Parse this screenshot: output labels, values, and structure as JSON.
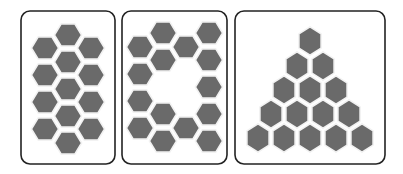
{
  "colors": {
    "background": "#ffffff",
    "hex_fill": "#6a6a6a",
    "hex_gap": "#f2f2f2",
    "border": "#222222"
  },
  "panels": [
    {
      "name": "panel-column-arrangement",
      "box": {
        "x": 21,
        "y": 11,
        "w": 94,
        "h": 153
      },
      "orientation": "flat",
      "hex_count": 13,
      "hexes": [
        [
          68,
          35
        ],
        [
          68,
          62
        ],
        [
          68,
          89
        ],
        [
          68,
          116
        ],
        [
          68,
          143
        ],
        [
          45,
          48
        ],
        [
          45,
          75
        ],
        [
          45,
          102
        ],
        [
          45,
          129
        ],
        [
          91,
          48
        ],
        [
          91,
          75
        ],
        [
          91,
          102
        ],
        [
          91,
          129
        ]
      ]
    },
    {
      "name": "panel-ring-arrangement",
      "box": {
        "x": 122,
        "y": 11,
        "w": 105,
        "h": 153
      },
      "orientation": "flat",
      "hex_count": 15,
      "hexes": [
        [
          140,
          47
        ],
        [
          140,
          74
        ],
        [
          140,
          101
        ],
        [
          140,
          128
        ],
        [
          163,
          33
        ],
        [
          163,
          60
        ],
        [
          163,
          114
        ],
        [
          163,
          141
        ],
        [
          186,
          47
        ],
        [
          186,
          128
        ],
        [
          209,
          33
        ],
        [
          209,
          60
        ],
        [
          209,
          87
        ],
        [
          209,
          114
        ],
        [
          209,
          141
        ]
      ]
    },
    {
      "name": "panel-triangle-arrangement",
      "box": {
        "x": 235,
        "y": 11,
        "w": 150,
        "h": 153
      },
      "orientation": "pointy",
      "hex_count": 15,
      "hexes": [
        [
          310,
          41
        ],
        [
          297,
          66
        ],
        [
          323,
          66
        ],
        [
          284,
          90
        ],
        [
          310,
          90
        ],
        [
          336,
          90
        ],
        [
          271,
          114
        ],
        [
          297,
          114
        ],
        [
          323,
          114
        ],
        [
          349,
          114
        ],
        [
          258,
          138
        ],
        [
          284,
          138
        ],
        [
          310,
          138
        ],
        [
          336,
          138
        ],
        [
          362,
          138
        ]
      ]
    }
  ]
}
